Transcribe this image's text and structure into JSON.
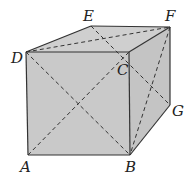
{
  "diagram": {
    "type": "cube-with-diagonals",
    "fill_color": "#c9c9c9",
    "stroke_color": "#333333",
    "points": {
      "A": {
        "x": 28,
        "y": 155,
        "label": "A",
        "lx": 20,
        "ly": 172
      },
      "B": {
        "x": 130,
        "y": 155,
        "label": "B",
        "lx": 125,
        "ly": 172
      },
      "C": {
        "x": 129,
        "y": 52,
        "label": "C",
        "lx": 117,
        "ly": 75
      },
      "D": {
        "x": 26,
        "y": 52,
        "label": "D",
        "lx": 12,
        "ly": 63
      },
      "E": {
        "x": 91,
        "y": 26,
        "label": "E",
        "lx": 82,
        "ly": 21
      },
      "F": {
        "x": 170,
        "y": 27,
        "label": "F",
        "lx": 165,
        "ly": 21
      },
      "G": {
        "x": 170,
        "y": 105,
        "label": "G",
        "lx": 172,
        "ly": 115
      }
    },
    "labels": {
      "A": "A",
      "B": "B",
      "C": "C",
      "D": "D",
      "E": "E",
      "F": "F",
      "G": "G"
    },
    "solid_edges": [
      "AB",
      "BC",
      "CD",
      "DA",
      "DE",
      "EF",
      "FC",
      "FG",
      "GB"
    ],
    "dashed_segments": [
      "DB",
      "AC",
      "DF",
      "EG",
      "FB"
    ]
  }
}
